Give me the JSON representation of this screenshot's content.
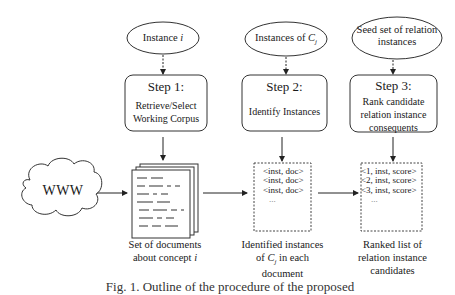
{
  "inputs": [
    {
      "id": "instance-i",
      "text": "Instance ",
      "var": "i"
    },
    {
      "id": "instances-cj",
      "text": "Instances of ",
      "var": "C",
      "sub": "j"
    },
    {
      "id": "seed-set",
      "line1": "Seed set of relation",
      "line2": "instances"
    }
  ],
  "steps": [
    {
      "title": "Step 1:",
      "desc_line1": "Retrieve/Select",
      "desc_line2": "Working Corpus"
    },
    {
      "title": "Step 2:",
      "desc_line1": "Identify Instances"
    },
    {
      "title": "Step 3:",
      "desc_line1": "Rank candidate",
      "desc_line2": "relation instance",
      "desc_line3": "consequents"
    }
  ],
  "source": {
    "label": "WWW"
  },
  "outputs": [
    {
      "line1": "Set of documents",
      "line2_text": "about concept ",
      "line2_var": "i"
    },
    {
      "line1": "Identified instances",
      "line2_pre": "of ",
      "line2_var": "C",
      "line2_sub": "j",
      "line2_post": " in each",
      "line3": "document",
      "items": [
        "<inst, doc>",
        "<inst, doc>",
        "<inst, doc>",
        "..."
      ]
    },
    {
      "line1": "Ranked list of",
      "line2": "relation instance",
      "line3": "candidates",
      "items": [
        "<1, inst, score>",
        "<2, inst, score>",
        "<3, inst, score>",
        "..."
      ]
    }
  ],
  "caption": "Fig. 1. Outline of the procedure of the proposed"
}
